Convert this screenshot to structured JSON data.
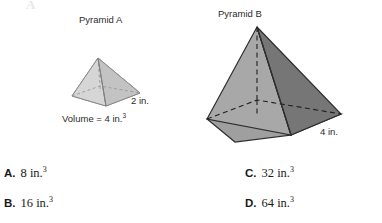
{
  "ghost_artifact": "A",
  "figures": {
    "pyramid_a": {
      "title": "Pyramid A",
      "edge_label": "2 in.",
      "volume_label": "Volume = 4 in.",
      "volume_exponent": "3",
      "base_edge_value": 2,
      "volume_value": 4,
      "volume_units": "in.³",
      "fill_left": "#d4d4d4",
      "fill_right": "#c2c2c2",
      "fill_base": "#cfcfcf",
      "stroke": "#8a8a8a"
    },
    "pyramid_b": {
      "title": "Pyramid B",
      "edge_label": "4 in.",
      "base_edge_value": 4,
      "fill_left": "#a8a8a8",
      "fill_right": "#767676",
      "fill_base": "#9a9a9a",
      "stroke": "#2e2e2e"
    }
  },
  "choices": [
    {
      "letter": "A.",
      "value": "8 in.",
      "exponent": "3"
    },
    {
      "letter": "B.",
      "value": "16 in.",
      "exponent": "3"
    },
    {
      "letter": "C.",
      "value": "32 in.",
      "exponent": "3"
    },
    {
      "letter": "D.",
      "value": "64 in.",
      "exponent": "3"
    }
  ]
}
